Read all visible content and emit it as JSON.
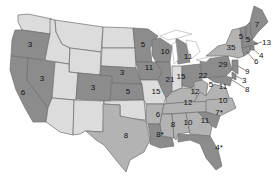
{
  "colors": {
    "dark": "#8c8c8c",
    "medium": "#b3b3b3",
    "light": "#dcdcdc",
    "background": "#ffffff",
    "border": "#6f6f6f"
  },
  "states": {
    "WA": {
      "value": "",
      "shade": "light"
    },
    "OR": {
      "value": "3",
      "shade": "dark"
    },
    "CA": {
      "value": "6",
      "shade": "dark"
    },
    "NV": {
      "value": "3",
      "shade": "dark"
    },
    "ID": {
      "value": "",
      "shade": "light"
    },
    "MT": {
      "value": "",
      "shade": "light"
    },
    "WY": {
      "value": "",
      "shade": "light"
    },
    "UT": {
      "value": "",
      "shade": "light"
    },
    "CO": {
      "value": "3",
      "shade": "dark"
    },
    "AZ": {
      "value": "",
      "shade": "light"
    },
    "NM": {
      "value": "",
      "shade": "light"
    },
    "ND": {
      "value": "",
      "shade": "light"
    },
    "SD": {
      "value": "",
      "shade": "light"
    },
    "NE": {
      "value": "3",
      "shade": "dark"
    },
    "KS": {
      "value": "5",
      "shade": "dark"
    },
    "OK": {
      "value": "",
      "shade": "light"
    },
    "TX": {
      "value": "8",
      "shade": "medium"
    },
    "MN": {
      "value": "5",
      "shade": "dark"
    },
    "IA": {
      "value": "11",
      "shade": "dark"
    },
    "MO": {
      "value": "15",
      "shade": "light"
    },
    "AR": {
      "value": "6",
      "shade": "medium"
    },
    "LA": {
      "value": "8*",
      "shade": "dark"
    },
    "WI": {
      "value": "10",
      "shade": "dark"
    },
    "IL": {
      "value": "21",
      "shade": "dark"
    },
    "MI": {
      "value": "11",
      "shade": "dark"
    },
    "IN": {
      "value": "15",
      "shade": "light"
    },
    "OH": {
      "value": "22",
      "shade": "dark"
    },
    "KY": {
      "value": "12",
      "shade": "medium"
    },
    "TN": {
      "value": "12",
      "shade": "medium"
    },
    "MS": {
      "value": "8",
      "shade": "medium"
    },
    "AL": {
      "value": "10",
      "shade": "medium"
    },
    "GA": {
      "value": "11",
      "shade": "medium"
    },
    "FL": {
      "value": "4*",
      "shade": "dark"
    },
    "WV": {
      "value": "5",
      "shade": "medium"
    },
    "VA": {
      "value": "11",
      "shade": "medium"
    },
    "NC": {
      "value": "10",
      "shade": "medium"
    },
    "SC": {
      "value": "7*",
      "shade": "dark"
    },
    "PA": {
      "value": "29",
      "shade": "dark"
    },
    "NY": {
      "value": "35",
      "shade": "medium"
    },
    "VT": {
      "value": "5",
      "shade": "dark"
    },
    "NH": {
      "value": "5",
      "shade": "dark"
    },
    "ME": {
      "value": "7",
      "shade": "dark"
    },
    "MA": {
      "value": "13",
      "shade": "dark"
    },
    "RI": {
      "value": "4",
      "shade": "dark"
    },
    "CT": {
      "value": "6",
      "shade": "dark"
    },
    "NJ": {
      "value": "9",
      "shade": "dark"
    },
    "DE": {
      "value": "3",
      "shade": "dark"
    },
    "MD": {
      "value": "8",
      "shade": "dark"
    }
  }
}
